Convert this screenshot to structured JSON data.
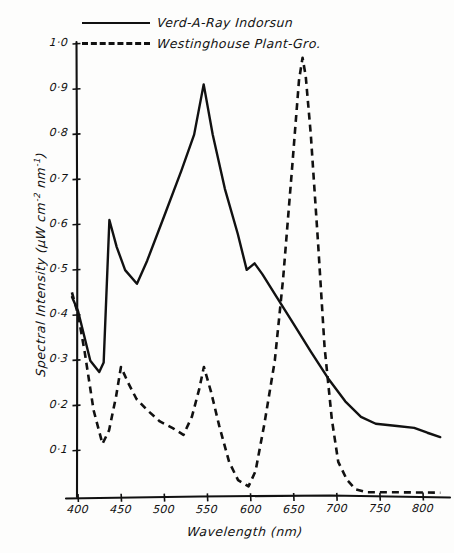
{
  "chart_data": {
    "type": "line",
    "title": "",
    "xlabel": "Wavelength (nm)",
    "ylabel": "Spectral Intensity (μW cm⁻² nm⁻¹)",
    "ylabel_parts": {
      "prefix": "Spectral Intensity (",
      "unit_a": "μW cm",
      "exp_a": "-2",
      "unit_b": " nm",
      "exp_b": "-1",
      "suffix": ")"
    },
    "xlim": [
      390,
      825
    ],
    "ylim": [
      0,
      1.0
    ],
    "grid": false,
    "legend_position": "top-left",
    "xticks": [
      400,
      450,
      500,
      550,
      600,
      650,
      700,
      750,
      800
    ],
    "xtick_labels": [
      "400",
      "450",
      "500",
      "550",
      "600",
      "650",
      "700",
      "750",
      "800"
    ],
    "yticks": [
      0.1,
      0.2,
      0.3,
      0.4,
      0.5,
      0.6,
      0.7,
      0.8,
      0.9,
      1.0
    ],
    "ytick_labels": [
      "0·1",
      "0·2",
      "0·3",
      "0·4",
      "0·5",
      "0·6",
      "0·7",
      "0·8",
      "0·9",
      "1·0"
    ],
    "series": [
      {
        "name": "Verd-A-Ray Indorsun",
        "style": "solid",
        "color": "#111111",
        "points": [
          [
            393,
            0.44
          ],
          [
            400,
            0.41
          ],
          [
            405,
            0.37
          ],
          [
            414,
            0.3
          ],
          [
            425,
            0.275
          ],
          [
            430,
            0.295
          ],
          [
            436,
            0.61
          ],
          [
            445,
            0.55
          ],
          [
            455,
            0.5
          ],
          [
            468,
            0.47
          ],
          [
            480,
            0.52
          ],
          [
            500,
            0.62
          ],
          [
            520,
            0.72
          ],
          [
            535,
            0.8
          ],
          [
            546,
            0.91
          ],
          [
            556,
            0.8
          ],
          [
            570,
            0.68
          ],
          [
            585,
            0.58
          ],
          [
            596,
            0.5
          ],
          [
            605,
            0.515
          ],
          [
            614,
            0.49
          ],
          [
            630,
            0.44
          ],
          [
            650,
            0.38
          ],
          [
            670,
            0.32
          ],
          [
            690,
            0.26
          ],
          [
            710,
            0.21
          ],
          [
            728,
            0.175
          ],
          [
            745,
            0.16
          ],
          [
            770,
            0.155
          ],
          [
            790,
            0.15
          ],
          [
            805,
            0.14
          ],
          [
            820,
            0.13
          ]
        ]
      },
      {
        "name": "Westinghouse Plant-Gro.",
        "style": "dashed",
        "color": "#111111",
        "points": [
          [
            393,
            0.45
          ],
          [
            400,
            0.4
          ],
          [
            408,
            0.32
          ],
          [
            418,
            0.19
          ],
          [
            428,
            0.115
          ],
          [
            436,
            0.145
          ],
          [
            444,
            0.22
          ],
          [
            450,
            0.285
          ],
          [
            458,
            0.25
          ],
          [
            468,
            0.215
          ],
          [
            480,
            0.19
          ],
          [
            495,
            0.165
          ],
          [
            510,
            0.15
          ],
          [
            522,
            0.135
          ],
          [
            532,
            0.175
          ],
          [
            540,
            0.235
          ],
          [
            546,
            0.285
          ],
          [
            554,
            0.23
          ],
          [
            564,
            0.155
          ],
          [
            575,
            0.075
          ],
          [
            586,
            0.035
          ],
          [
            598,
            0.022
          ],
          [
            606,
            0.055
          ],
          [
            616,
            0.16
          ],
          [
            628,
            0.3
          ],
          [
            638,
            0.48
          ],
          [
            648,
            0.72
          ],
          [
            656,
            0.92
          ],
          [
            660,
            0.97
          ],
          [
            664,
            0.93
          ],
          [
            670,
            0.8
          ],
          [
            678,
            0.56
          ],
          [
            686,
            0.33
          ],
          [
            694,
            0.17
          ],
          [
            702,
            0.075
          ],
          [
            712,
            0.035
          ],
          [
            722,
            0.015
          ],
          [
            735,
            0.008
          ],
          [
            760,
            0.008
          ],
          [
            790,
            0.008
          ],
          [
            820,
            0.008
          ]
        ]
      }
    ]
  },
  "legend": {
    "entries": [
      {
        "label": "Verd-A-Ray Indorsun",
        "style": "solid"
      },
      {
        "label": "Westinghouse Plant-Gro.",
        "style": "dashed"
      }
    ]
  }
}
